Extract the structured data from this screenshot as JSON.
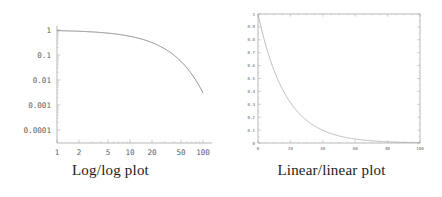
{
  "figure": {
    "panels": [
      {
        "id": "loglog",
        "caption": "Log/log plot",
        "frame_style": "L-axes"
      },
      {
        "id": "linlin",
        "caption": "Linear/linear plot",
        "frame_style": "box"
      }
    ]
  },
  "chart_data": [
    {
      "type": "line",
      "id": "loglog",
      "title": "Log/log plot",
      "xlabel": "",
      "ylabel": "",
      "xscale": "log",
      "yscale": "log",
      "xlim": [
        1,
        100
      ],
      "ylim": [
        3e-05,
        1
      ],
      "grid": false,
      "legend": false,
      "xticks": [
        1,
        2,
        5,
        10,
        20,
        50,
        100
      ],
      "xticklabels": [
        "1",
        "2",
        "5",
        "10",
        "20",
        "50",
        "100"
      ],
      "yticks": [
        1,
        0.1,
        0.01,
        0.001,
        0.0001
      ],
      "yticklabels": [
        "1",
        "0.1",
        "0.01",
        "0.001",
        "0.0001"
      ],
      "series": [
        {
          "name": "exp(-0.058 x)",
          "x": [
            1,
            2,
            5,
            10,
            15,
            20,
            30,
            40,
            50,
            60,
            70,
            80,
            90,
            100
          ],
          "y": [
            0.9436,
            0.8904,
            0.7482,
            0.5599,
            0.4189,
            0.3135,
            0.1755,
            0.0983,
            0.055,
            0.0308,
            0.0173,
            0.0097,
            0.0054,
            0.003
          ]
        }
      ]
    },
    {
      "type": "line",
      "id": "linlin",
      "title": "Linear/linear plot",
      "xlabel": "",
      "ylabel": "",
      "xscale": "linear",
      "yscale": "linear",
      "xlim": [
        0,
        100
      ],
      "ylim": [
        0,
        1
      ],
      "grid": false,
      "legend": false,
      "xticks": [
        0,
        20,
        40,
        60,
        80,
        100
      ],
      "xticklabels": [
        "0",
        "20",
        "40",
        "60",
        "80",
        "100"
      ],
      "yticks": [
        0,
        0.1,
        0.2,
        0.3,
        0.4,
        0.5,
        0.6,
        0.7,
        0.8,
        0.9,
        1
      ],
      "yticklabels": [
        "0",
        "0.1",
        "0.2",
        "0.3",
        "0.4",
        "0.5",
        "0.6",
        "0.7",
        "0.8",
        "0.9",
        "1"
      ],
      "series": [
        {
          "name": "exp(-0.058 x)",
          "x": [
            0,
            5,
            10,
            15,
            20,
            25,
            30,
            35,
            40,
            45,
            50,
            55,
            60,
            65,
            70,
            75,
            80,
            85,
            90,
            95,
            100
          ],
          "y": [
            1.0,
            0.7482,
            0.5599,
            0.4189,
            0.3135,
            0.2346,
            0.1755,
            0.1313,
            0.0983,
            0.0735,
            0.055,
            0.0412,
            0.0308,
            0.023,
            0.0173,
            0.0129,
            0.0097,
            0.0072,
            0.0054,
            0.0041,
            0.003
          ]
        }
      ]
    }
  ]
}
